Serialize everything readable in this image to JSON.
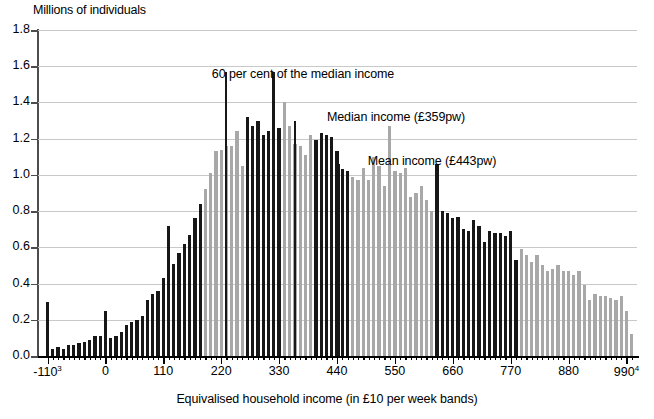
{
  "chart_data": {
    "type": "bar",
    "title": "",
    "ylabel": "Millions of individuals",
    "xlabel": "Equivalised household income (in £10 per week bands)",
    "ylim": [
      0.0,
      1.8
    ],
    "ytick_labels": [
      "0.0",
      "0.2",
      "0.4",
      "0.6",
      "0.8",
      "1.0",
      "1.2",
      "1.4",
      "1.6",
      "1.8"
    ],
    "ytick_values": [
      0.0,
      0.2,
      0.4,
      0.6,
      0.8,
      1.0,
      1.2,
      1.4,
      1.6,
      1.8
    ],
    "xtick_labels": [
      "-110",
      "0",
      "110",
      "220",
      "330",
      "440",
      "550",
      "660",
      "770",
      "880",
      "990"
    ],
    "xtick_values": [
      -110,
      0,
      110,
      220,
      330,
      440,
      550,
      660,
      770,
      880,
      990
    ],
    "xtick_superscripts": {
      "-110": "3",
      "990": "4"
    },
    "xlim": [
      -130,
      1010
    ],
    "grid": "horizontal",
    "legend": "none",
    "bar_colors": {
      "dark": "#171717",
      "light": "#a8a8a8"
    },
    "annotations": [
      {
        "text": "60 per cent of the median income",
        "value": 1.57,
        "x": 228,
        "label_x": 303,
        "label_y": 67
      },
      {
        "text": "Median income (£359pw)",
        "value": 1.3,
        "x": 359,
        "label_x": 396,
        "label_y": 110
      },
      {
        "text": "Mean income (£443pw)",
        "value": 1.06,
        "x": 443,
        "label_x": 432,
        "label_y": 154
      }
    ],
    "categories": [
      -110,
      -100,
      -90,
      -80,
      -70,
      -60,
      -50,
      -40,
      -30,
      -20,
      -10,
      0,
      10,
      20,
      30,
      40,
      50,
      60,
      70,
      80,
      90,
      100,
      110,
      120,
      130,
      140,
      150,
      160,
      170,
      180,
      190,
      200,
      210,
      220,
      230,
      240,
      250,
      260,
      270,
      280,
      290,
      300,
      310,
      320,
      330,
      340,
      350,
      360,
      370,
      380,
      390,
      400,
      410,
      420,
      430,
      440,
      450,
      460,
      470,
      480,
      490,
      500,
      510,
      520,
      530,
      540,
      550,
      560,
      570,
      580,
      590,
      600,
      610,
      620,
      630,
      640,
      650,
      660,
      670,
      680,
      690,
      700,
      710,
      720,
      730,
      740,
      750,
      760,
      770,
      780,
      790,
      800,
      810,
      820,
      830,
      840,
      850,
      860,
      870,
      880,
      890,
      900,
      910,
      920,
      930,
      940,
      950,
      960,
      970,
      980,
      990,
      1000
    ],
    "values": [
      0.3,
      0.04,
      0.05,
      0.04,
      0.06,
      0.06,
      0.07,
      0.08,
      0.09,
      0.11,
      0.11,
      0.25,
      0.1,
      0.11,
      0.13,
      0.17,
      0.19,
      0.2,
      0.22,
      0.31,
      0.34,
      0.36,
      0.43,
      0.72,
      0.51,
      0.57,
      0.62,
      0.67,
      0.76,
      0.84,
      0.92,
      1.01,
      1.13,
      1.14,
      1.16,
      1.16,
      1.24,
      1.05,
      1.32,
      1.27,
      1.3,
      1.22,
      1.24,
      1.57,
      1.26,
      1.4,
      1.27,
      1.17,
      1.16,
      1.11,
      1.22,
      1.19,
      1.23,
      1.22,
      1.21,
      1.13,
      1.03,
      1.02,
      0.99,
      0.97,
      1.04,
      0.97,
      1.1,
      1.05,
      0.94,
      1.27,
      1.02,
      1.01,
      1.04,
      0.88,
      0.9,
      0.94,
      0.86,
      0.8,
      1.06,
      0.8,
      0.79,
      0.76,
      0.77,
      0.7,
      0.69,
      0.75,
      0.72,
      0.63,
      0.69,
      0.68,
      0.68,
      0.66,
      0.69,
      0.53,
      0.59,
      0.56,
      0.52,
      0.56,
      0.5,
      0.47,
      0.48,
      0.5,
      0.47,
      0.47,
      0.45,
      0.47,
      0.39,
      0.31,
      0.34,
      0.33,
      0.33,
      0.32,
      0.31,
      0.33,
      0.25,
      0.12
    ],
    "shades": [
      "dark",
      "dark",
      "dark",
      "dark",
      "dark",
      "dark",
      "dark",
      "dark",
      "dark",
      "dark",
      "dark",
      "dark",
      "dark",
      "dark",
      "dark",
      "dark",
      "dark",
      "dark",
      "dark",
      "dark",
      "dark",
      "dark",
      "dark",
      "dark",
      "dark",
      "dark",
      "dark",
      "dark",
      "dark",
      "dark",
      "light",
      "light",
      "light",
      "light",
      "light",
      "light",
      "light",
      "light",
      "dark",
      "dark",
      "dark",
      "dark",
      "dark",
      "dark",
      "dark",
      "light",
      "light",
      "light",
      "light",
      "light",
      "light",
      "dark",
      "dark",
      "dark",
      "dark",
      "dark",
      "dark",
      "dark",
      "light",
      "light",
      "light",
      "light",
      "light",
      "light",
      "light",
      "light",
      "light",
      "light",
      "light",
      "light",
      "light",
      "light",
      "light",
      "light",
      "dark",
      "dark",
      "dark",
      "dark",
      "dark",
      "dark",
      "dark",
      "dark",
      "dark",
      "dark",
      "dark",
      "dark",
      "dark",
      "dark",
      "dark",
      "dark",
      "light",
      "light",
      "light",
      "light",
      "light",
      "light",
      "light",
      "light",
      "light",
      "light",
      "light",
      "light",
      "light",
      "light",
      "light",
      "light",
      "light",
      "light",
      "light",
      "light",
      "light",
      "light"
    ]
  }
}
